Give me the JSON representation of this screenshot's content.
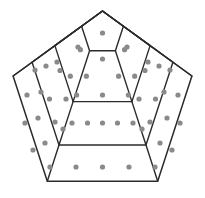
{
  "figure": {
    "shape_name": "pentagon",
    "ring_count": 4,
    "background_color": "#ffffff",
    "outline_color": "#2b2b2b",
    "dot_color": "#8a8a8a",
    "dot_radius": 2.6,
    "center": {
      "x": 102.5,
      "y": 99
    },
    "rings": [
      {
        "index": 1,
        "label": "innermost-pentagon",
        "circumradius": 22,
        "dot_count": 1,
        "vertices": [
          {
            "x": 102.5,
            "y": 11.0
          },
          {
            "x": 123.4,
            "y": 26.2
          },
          {
            "x": 115.4,
            "y": 50.8
          },
          {
            "x": 89.6,
            "y": 50.8
          },
          {
            "x": 81.6,
            "y": 26.2
          }
        ]
      },
      {
        "index": 2,
        "label": "second-pentagon",
        "circumradius": 50,
        "dot_count": 10,
        "vertices": [
          {
            "x": 102.5,
            "y": 11.0
          },
          {
            "x": 150.1,
            "y": 45.6
          },
          {
            "x": 131.9,
            "y": 101.6
          },
          {
            "x": 73.1,
            "y": 101.6
          },
          {
            "x": 54.9,
            "y": 45.6
          }
        ]
      },
      {
        "index": 3,
        "label": "third-pentagon",
        "circumradius": 74,
        "dot_count": 15,
        "vertices": [
          {
            "x": 102.5,
            "y": 11.0
          },
          {
            "x": 172.9,
            "y": 62.2
          },
          {
            "x": 146.0,
            "y": 145.0
          },
          {
            "x": 59.0,
            "y": 145.0
          },
          {
            "x": 32.1,
            "y": 62.2
          }
        ]
      },
      {
        "index": 4,
        "label": "outermost-pentagon",
        "circumradius": 94,
        "dot_count": 20,
        "vertices": [
          {
            "x": 102.5,
            "y": 11.0
          },
          {
            "x": 191.9,
            "y": 76.0
          },
          {
            "x": 157.7,
            "y": 181.2
          },
          {
            "x": 47.3,
            "y": 181.2
          },
          {
            "x": 13.1,
            "y": 76.0
          }
        ]
      }
    ],
    "spokes": {
      "label": "radial-vertex-spokes",
      "count": 4,
      "description": "Lines from inner pentagon vertices outward to the outermost pentagon vertices, excluding the shared top apex"
    },
    "dots": [
      {
        "x": 102.5,
        "y": 33.0
      },
      {
        "x": 102.5,
        "y": 59.0
      },
      {
        "x": 80.4,
        "y": 49.7
      },
      {
        "x": 124.6,
        "y": 49.7
      },
      {
        "x": 70.3,
        "y": 76.2
      },
      {
        "x": 134.7,
        "y": 76.2
      },
      {
        "x": 86.4,
        "y": 76.2
      },
      {
        "x": 118.6,
        "y": 76.2
      },
      {
        "x": 76.6,
        "y": 95.0
      },
      {
        "x": 128.4,
        "y": 95.0
      },
      {
        "x": 102.5,
        "y": 95.0
      },
      {
        "x": 60.0,
        "y": 70.5
      },
      {
        "x": 145.0,
        "y": 70.5
      },
      {
        "x": 49.5,
        "y": 99.0
      },
      {
        "x": 155.5,
        "y": 99.0
      },
      {
        "x": 55.0,
        "y": 122.0
      },
      {
        "x": 150.0,
        "y": 122.0
      },
      {
        "x": 63.0,
        "y": 129.0
      },
      {
        "x": 142.0,
        "y": 129.0
      },
      {
        "x": 72.0,
        "y": 123.0
      },
      {
        "x": 133.0,
        "y": 123.0
      },
      {
        "x": 102.5,
        "y": 123.0
      },
      {
        "x": 87.5,
        "y": 123.0
      },
      {
        "x": 117.5,
        "y": 123.0
      },
      {
        "x": 41.0,
        "y": 92.0
      },
      {
        "x": 164.0,
        "y": 92.0
      },
      {
        "x": 38.0,
        "y": 118.0
      },
      {
        "x": 167.0,
        "y": 118.0
      },
      {
        "x": 45.0,
        "y": 143.0
      },
      {
        "x": 160.0,
        "y": 143.0
      },
      {
        "x": 27.0,
        "y": 95.0
      },
      {
        "x": 178.0,
        "y": 95.0
      },
      {
        "x": 25.0,
        "y": 123.0
      },
      {
        "x": 180.0,
        "y": 123.0
      },
      {
        "x": 33.0,
        "y": 150.0
      },
      {
        "x": 172.0,
        "y": 150.0
      },
      {
        "x": 50.0,
        "y": 167.0
      },
      {
        "x": 155.0,
        "y": 167.0
      },
      {
        "x": 76.0,
        "y": 167.0
      },
      {
        "x": 129.0,
        "y": 167.0
      },
      {
        "x": 102.5,
        "y": 167.0
      },
      {
        "x": 57.0,
        "y": 62.0
      },
      {
        "x": 148.0,
        "y": 62.0
      },
      {
        "x": 46.0,
        "y": 66.0
      },
      {
        "x": 159.0,
        "y": 66.0
      },
      {
        "x": 35.0,
        "y": 70.0
      },
      {
        "x": 170.0,
        "y": 70.0
      },
      {
        "x": 78.0,
        "y": 47.0
      },
      {
        "x": 127.0,
        "y": 47.0
      },
      {
        "x": 66.0,
        "y": 99.0
      },
      {
        "x": 139.0,
        "y": 99.0
      }
    ]
  }
}
